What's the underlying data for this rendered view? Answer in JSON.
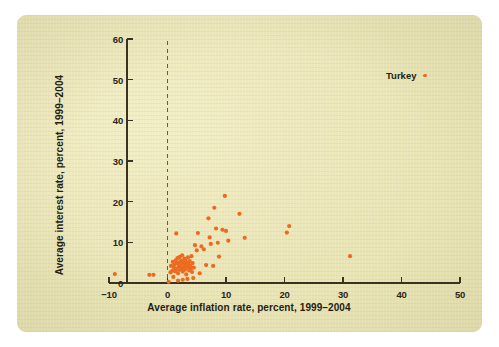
{
  "figure": {
    "paper_color": "#e9e4b4",
    "page_color": "#ffffff",
    "marker_color": "#ed6a20",
    "axis_color": "#3a3120"
  },
  "legend": {
    "label": "Turkey",
    "marker_name": "turkey-marker-swatch"
  },
  "chart_data": {
    "type": "scatter",
    "title": "",
    "subtitle": "",
    "xlabel": "Average inflation rate, percent, 1999–2004",
    "ylabel": "Average interest rate, percent, 1999–2004",
    "xlim": [
      -10,
      50
    ],
    "ylim": [
      0,
      60
    ],
    "xticks": [
      -10,
      0,
      10,
      20,
      30,
      40,
      50
    ],
    "xticklabels": [
      "−10",
      "0",
      "10",
      "20",
      "30",
      "40",
      "50"
    ],
    "yticks": [
      0,
      10,
      20,
      30,
      40,
      50,
      60
    ],
    "yticklabels": [
      "0",
      "10",
      "20",
      "30",
      "40",
      "50",
      "60"
    ],
    "grid": false,
    "legend": {
      "position": "top-right",
      "entries": [
        "Turkey"
      ]
    },
    "annotations": [
      {
        "type": "vline",
        "x": 0,
        "style": "dashed",
        "color": "#6b5d33",
        "label": "zero inflation reference line"
      }
    ],
    "series": [
      {
        "name": "Countries",
        "marker": "circle",
        "color": "#ed6a20",
        "points": [
          [
            -9.0,
            2.2
          ],
          [
            -3.1,
            2.0
          ],
          [
            -2.4,
            2.0
          ],
          [
            0.2,
            0.3
          ],
          [
            0.5,
            2.6
          ],
          [
            0.6,
            4.2
          ],
          [
            0.8,
            3.0
          ],
          [
            0.9,
            5.2
          ],
          [
            1.0,
            1.5
          ],
          [
            1.1,
            3.8
          ],
          [
            1.2,
            4.6
          ],
          [
            1.3,
            2.9
          ],
          [
            1.4,
            5.6
          ],
          [
            1.5,
            3.4
          ],
          [
            1.6,
            4.9
          ],
          [
            1.7,
            6.1
          ],
          [
            1.8,
            2.4
          ],
          [
            1.9,
            4.1
          ],
          [
            2.0,
            5.0
          ],
          [
            2.0,
            3.2
          ],
          [
            2.1,
            6.4
          ],
          [
            2.2,
            4.4
          ],
          [
            2.3,
            5.5
          ],
          [
            2.4,
            3.6
          ],
          [
            2.5,
            4.8
          ],
          [
            2.5,
            6.8
          ],
          [
            2.6,
            2.8
          ],
          [
            2.7,
            5.2
          ],
          [
            2.8,
            4.0
          ],
          [
            2.9,
            6.0
          ],
          [
            3.0,
            3.3
          ],
          [
            3.0,
            5.8
          ],
          [
            3.1,
            4.5
          ],
          [
            3.2,
            2.1
          ],
          [
            3.3,
            5.1
          ],
          [
            3.4,
            3.9
          ],
          [
            3.5,
            6.3
          ],
          [
            3.6,
            4.7
          ],
          [
            3.7,
            3.1
          ],
          [
            3.8,
            5.4
          ],
          [
            3.9,
            4.2
          ],
          [
            4.0,
            3.5
          ],
          [
            4.1,
            6.6
          ],
          [
            4.2,
            2.7
          ],
          [
            4.3,
            4.9
          ],
          [
            4.5,
            3.8
          ],
          [
            4.7,
            9.3
          ],
          [
            1.8,
            0.6
          ],
          [
            2.6,
            0.8
          ],
          [
            3.4,
            1.0
          ],
          [
            4.4,
            1.2
          ],
          [
            5.5,
            2.4
          ],
          [
            5.0,
            8.0
          ],
          [
            5.2,
            12.3
          ],
          [
            5.8,
            9.0
          ],
          [
            6.2,
            8.3
          ],
          [
            6.6,
            4.4
          ],
          [
            7.0,
            15.9
          ],
          [
            7.2,
            11.2
          ],
          [
            7.4,
            9.6
          ],
          [
            7.8,
            4.2
          ],
          [
            8.0,
            18.5
          ],
          [
            8.3,
            13.4
          ],
          [
            8.6,
            9.9
          ],
          [
            8.8,
            6.5
          ],
          [
            9.4,
            13.1
          ],
          [
            9.8,
            21.4
          ],
          [
            10.0,
            12.8
          ],
          [
            10.4,
            10.4
          ],
          [
            12.3,
            17.0
          ],
          [
            13.2,
            11.1
          ],
          [
            20.4,
            12.4
          ],
          [
            20.8,
            14.0
          ],
          [
            31.2,
            6.6
          ],
          [
            1.5,
            12.2
          ]
        ]
      }
    ]
  }
}
